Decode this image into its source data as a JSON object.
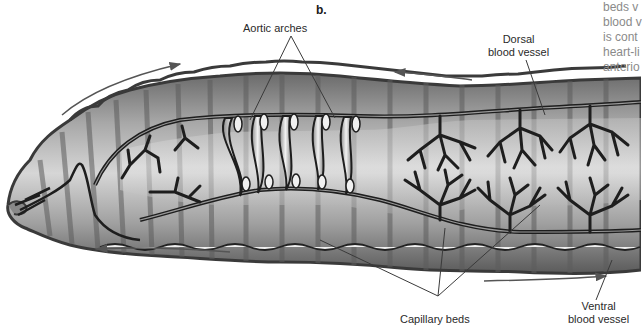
{
  "figure": {
    "panel_letter": "b.",
    "labels": {
      "aortic_arches": "Aortic arches",
      "dorsal_vessel_line1": "Dorsal",
      "dorsal_vessel_line2": "blood vessel",
      "capillary_beds": "Capillary beds",
      "ventral_vessel_line1": "Ventral",
      "ventral_vessel_line2": "blood vessel"
    },
    "flow_arrows": [
      {
        "name": "dorsal-flow-forward-top-left",
        "direction": "anterior"
      },
      {
        "name": "dorsal-flow-forward-top-center",
        "direction": "anterior"
      },
      {
        "name": "ventral-flow-backward-bottom-left",
        "direction": "anterior"
      },
      {
        "name": "ventral-flow-backward-bottom-right",
        "direction": "posterior"
      }
    ],
    "colors": {
      "body_dark": "#4a4a4a",
      "body_mid": "#9a9a9a",
      "body_light": "#d8d8d8",
      "vessel": "#1e1e1e",
      "leader_line": "#3a3a3a",
      "arrow": "#555555"
    }
  },
  "side_text_fragment": {
    "lines": [
      "beds v",
      "blood v",
      "is cont",
      "heart-li",
      "anterio"
    ]
  }
}
